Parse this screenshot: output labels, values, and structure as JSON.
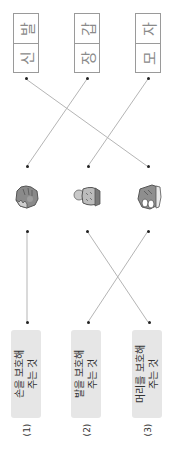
{
  "word_boxes": [
    {
      "id": "shoes",
      "top_char": "발",
      "bottom_char": "신",
      "word": "신발"
    },
    {
      "id": "gloves",
      "top_char": "갑",
      "bottom_char": "장",
      "word": "장갑"
    },
    {
      "id": "hat",
      "top_char": "자",
      "bottom_char": "모",
      "word": "모자"
    }
  ],
  "items": [
    {
      "id": "glove-icon",
      "label": "glove"
    },
    {
      "id": "hat-icon",
      "label": "knit hat"
    },
    {
      "id": "shoe-icon",
      "label": "sneaker"
    }
  ],
  "descriptions": [
    {
      "number": "(1)",
      "line1": "손을 보호해",
      "line2": "주는 것"
    },
    {
      "number": "(2)",
      "line1": "발을 보호해",
      "line2": "주는 것"
    },
    {
      "number": "(3)",
      "line1": "머리를 보호해",
      "line2": "주는 것"
    }
  ],
  "colors": {
    "line": "#b5b5b5",
    "box_border": "#9a9a9a",
    "text_box_bg": "#e6e6e6",
    "dot": "#222222"
  }
}
